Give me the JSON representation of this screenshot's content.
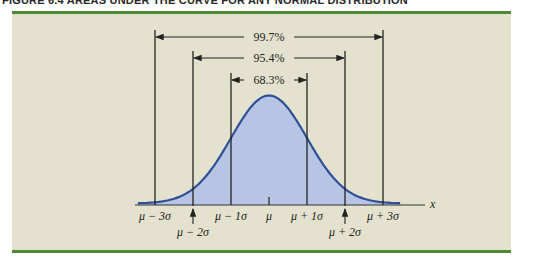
{
  "figure": {
    "title": "FIGURE 6.4   AREAS UNDER THE CURVE FOR ANY NORMAL DISTRIBUTION",
    "colors": {
      "panel_bg": "#e4e2cf",
      "rule": "#4c8a36",
      "curve_stroke": "#2f4f96",
      "curve_fill": "#b7c4e3",
      "line": "#222222"
    }
  },
  "chart_data": {
    "type": "area",
    "title": "Areas under the curve for any normal distribution",
    "xlabel": "x",
    "ylabel": "",
    "distribution": "normal",
    "tick_labels": [
      "μ − 3σ",
      "μ − 2σ",
      "μ − 1σ",
      "μ",
      "μ + 1σ",
      "μ + 2σ",
      "μ + 3σ"
    ],
    "tick_positions_sigma": [
      -3,
      -2,
      -1,
      0,
      1,
      2,
      3
    ],
    "intervals": [
      {
        "label": "68.3%",
        "from_sigma": -1,
        "to_sigma": 1,
        "value": 68.3
      },
      {
        "label": "95.4%",
        "from_sigma": -2,
        "to_sigma": 2,
        "value": 95.4
      },
      {
        "label": "99.7%",
        "from_sigma": -3,
        "to_sigma": 3,
        "value": 99.7
      }
    ],
    "grid": false,
    "legend": "none"
  }
}
